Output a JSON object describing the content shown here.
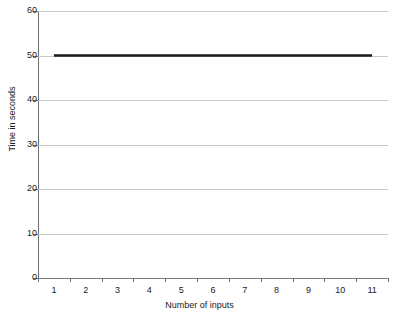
{
  "chart_data": {
    "type": "line",
    "title": "",
    "xlabel": "Number of inputs",
    "ylabel": "Time in seconds",
    "x": [
      1,
      2,
      3,
      4,
      5,
      6,
      7,
      8,
      9,
      10,
      11
    ],
    "categories": [
      "1",
      "2",
      "3",
      "4",
      "5",
      "6",
      "7",
      "8",
      "9",
      "10",
      "11"
    ],
    "series": [
      {
        "name": "Time",
        "values": [
          50,
          50,
          50,
          50,
          50,
          50,
          50,
          50,
          50,
          50,
          50
        ],
        "color": "#1a1a1a",
        "line_width": 2.5
      }
    ],
    "ylim": [
      0,
      60
    ],
    "yticks": [
      0,
      10,
      20,
      30,
      40,
      50,
      60
    ],
    "ytick_labels": [
      "0",
      "10",
      "20",
      "30",
      "40",
      "50",
      "60"
    ],
    "xlim": [
      0.5,
      11.5
    ],
    "xticks": [
      1,
      2,
      3,
      4,
      5,
      6,
      7,
      8,
      9,
      10,
      11
    ],
    "xtick_labels": [
      "1",
      "2",
      "3",
      "4",
      "5",
      "6",
      "7",
      "8",
      "9",
      "10",
      "11"
    ],
    "grid": "horizontal",
    "grid_color": "#c9c9c9",
    "axis_color": "#6e6e6e",
    "background": "#ffffff",
    "legend": "none"
  }
}
